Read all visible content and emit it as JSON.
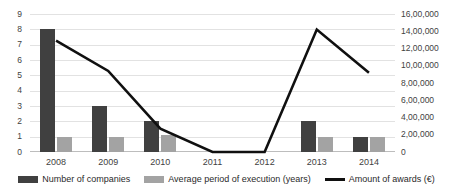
{
  "chart_data": {
    "type": "bar",
    "title": "",
    "xlabel": "",
    "categories": [
      "2008",
      "2009",
      "2010",
      "2011",
      "2012",
      "2013",
      "2014"
    ],
    "grid": true,
    "legend_position": "bottom",
    "series": [
      {
        "name": "Number of companies",
        "type": "bar",
        "axis": "left",
        "color": "#404040",
        "values": [
          8,
          3,
          2,
          0,
          0,
          2,
          1
        ]
      },
      {
        "name": "Average period of execution (years)",
        "type": "bar",
        "axis": "left",
        "color": "#a3a3a3",
        "values": [
          1,
          1,
          1.1,
          0,
          0,
          1,
          1
        ]
      },
      {
        "name": "Amount of awards (€)",
        "type": "line",
        "axis": "right",
        "color": "#101010",
        "values": [
          1290000,
          940000,
          270000,
          0,
          0,
          1420000,
          920000
        ]
      }
    ],
    "axes": {
      "left": {
        "label": "",
        "min": 0,
        "max": 9,
        "step": 1,
        "ticks": [
          "0",
          "1",
          "2",
          "3",
          "4",
          "5",
          "6",
          "7",
          "8",
          "9"
        ]
      },
      "right": {
        "label": "",
        "min": 0,
        "max": 1600000,
        "step": 200000,
        "ticks": [
          "0",
          "2,00,000",
          "4,00,000",
          "6,00,000",
          "8,00,000",
          "10,00,000",
          "12,00,000",
          "14,00,000",
          "16,00,000"
        ]
      }
    }
  },
  "legend": {
    "items": [
      {
        "label": "Number of companies",
        "swatch": "bar-dark"
      },
      {
        "label": "Average period of execution (years)",
        "swatch": "bar-gray"
      },
      {
        "label": "Amount of awards (€)",
        "swatch": "line-black"
      }
    ]
  },
  "colors": {
    "series_companies": "#404040",
    "series_period": "#a3a3a3",
    "series_awards": "#101010",
    "gridline": "#e2e2e2",
    "text": "#3f3f3f",
    "background": "#ffffff"
  }
}
